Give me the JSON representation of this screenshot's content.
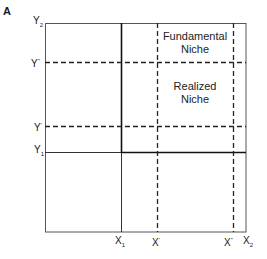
{
  "panel_label": "A",
  "y_axis": {
    "labels": [
      {
        "id": "y2",
        "base": "Y",
        "mark": "2",
        "type": "sub",
        "y": 23
      },
      {
        "id": "y_double_prime",
        "base": "Y",
        "mark": "''",
        "type": "sup",
        "y": 62
      },
      {
        "id": "y_prime",
        "base": "Y",
        "mark": "'",
        "type": "sup",
        "y": 126
      },
      {
        "id": "y1",
        "base": "Y",
        "mark": "1",
        "type": "sub",
        "y": 152
      }
    ]
  },
  "x_axis": {
    "labels": [
      {
        "id": "x1",
        "base": "X",
        "mark": "1",
        "type": "sub",
        "x": 121
      },
      {
        "id": "x_prime",
        "base": "X",
        "mark": "'",
        "type": "sup",
        "x": 157
      },
      {
        "id": "x_double_prime",
        "base": "X",
        "mark": "''",
        "type": "sup",
        "x": 233
      },
      {
        "id": "x2",
        "base": "X",
        "mark": "2",
        "type": "sub",
        "x": 246
      }
    ]
  },
  "regions": {
    "fundamental": {
      "line1": "Fundamental",
      "line2": "Niche"
    },
    "realized": {
      "line1": "Realized",
      "line2": "Niche"
    }
  },
  "colors": {
    "line": "#1a1a1a",
    "background": "#ffffff"
  }
}
